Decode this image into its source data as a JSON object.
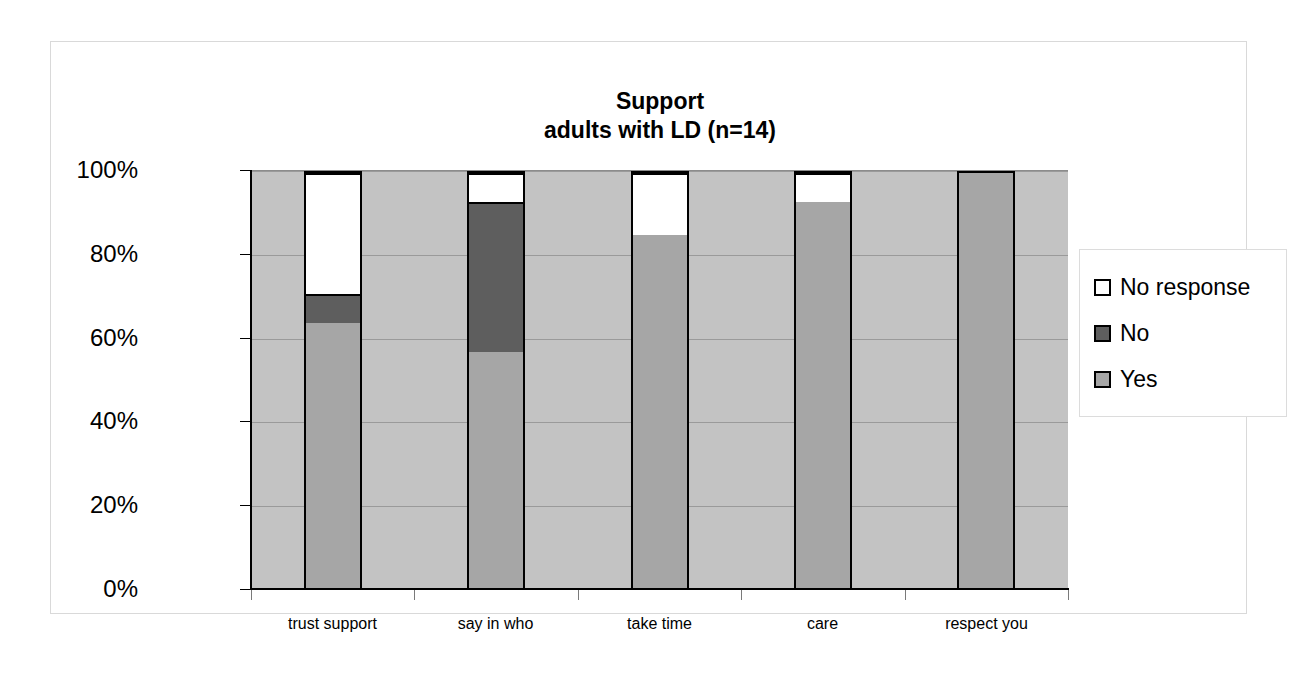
{
  "chart_data": {
    "type": "bar",
    "subtype": "stacked-100-percent",
    "title": "Support",
    "subtitle": "adults with LD (n=14)",
    "title_lines": [
      "Support",
      "adults with LD (n=14)"
    ],
    "xlabel": "",
    "ylabel": "",
    "ylim": [
      0,
      100
    ],
    "y_ticks": [
      "0%",
      "20%",
      "40%",
      "60%",
      "80%",
      "100%"
    ],
    "y_tick_values": [
      0,
      20,
      40,
      60,
      80,
      100
    ],
    "grid": true,
    "legend_position": "right",
    "categories": [
      "trust support",
      "say in who",
      "take time",
      "care",
      "respect you"
    ],
    "series": [
      {
        "name": "Yes",
        "color": "#a6a6a6",
        "values": [
          64,
          57,
          85,
          93,
          100
        ]
      },
      {
        "name": "No",
        "color": "#5e5e5e",
        "values": [
          7,
          36,
          0,
          0,
          0
        ]
      },
      {
        "name": "No response",
        "color": "#ffffff",
        "values": [
          29,
          7,
          15,
          7,
          0
        ]
      }
    ],
    "stack_order_bottom_to_top": [
      "Yes",
      "No",
      "No response"
    ],
    "legend": [
      {
        "label": "No response",
        "color": "#ffffff"
      },
      {
        "label": "No",
        "color": "#5e5e5e"
      },
      {
        "label": "Yes",
        "color": "#a6a6a6"
      }
    ],
    "plot_background": "#c3c3c3",
    "bar_border_color": "#000000"
  }
}
